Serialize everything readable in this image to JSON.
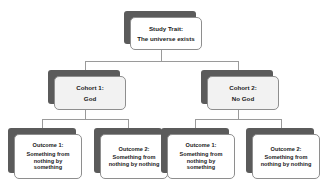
{
  "diagram": {
    "background_color": "#ffffff",
    "shadow_color": "#5b5b5b",
    "face_color": "#ffffff",
    "cohort_face_color": "#f2f2f2",
    "border_color": "#8e8e8e",
    "connector_color": "#9a9a9a",
    "text_color": "#1a1a1a"
  },
  "root": {
    "line1": "Study Trait:",
    "line2": "The universe exists"
  },
  "cohorts": [
    {
      "line1": "Cohort 1:",
      "line2": "God"
    },
    {
      "line1": "Cohort 2:",
      "line2": "No God"
    }
  ],
  "outcomes": [
    {
      "line1": "Outcome 1:",
      "line2": "Something from",
      "line3": "nothing by",
      "line4": "something"
    },
    {
      "line1": "Outcome 2:",
      "line2": "Something from",
      "line3": "nothing by nothing",
      "line4": ""
    },
    {
      "line1": "Outcome 1:",
      "line2": "Something from",
      "line3": "nothing by",
      "line4": "something"
    },
    {
      "line1": "Outcome 2:",
      "line2": "Something from",
      "line3": "nothing by nothing",
      "line4": ""
    }
  ]
}
